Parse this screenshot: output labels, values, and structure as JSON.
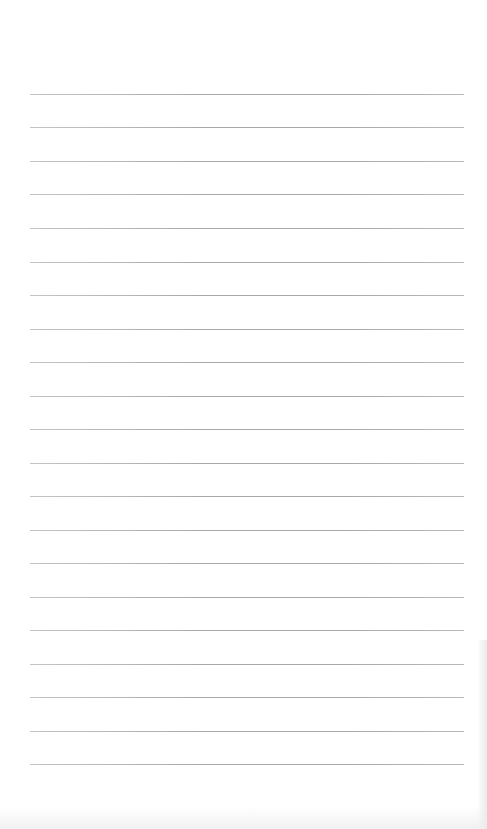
{
  "document": {
    "type": "lined-paper",
    "background_color": "#ffffff",
    "line_color": "#a9a9a9",
    "line_count": 21,
    "line_start_x": 30,
    "line_end_x": 464,
    "first_line_y": 94,
    "line_spacing": 33.5,
    "lines": [
      {
        "y": 94
      },
      {
        "y": 127
      },
      {
        "y": 161
      },
      {
        "y": 194
      },
      {
        "y": 228
      },
      {
        "y": 262
      },
      {
        "y": 295
      },
      {
        "y": 329
      },
      {
        "y": 362
      },
      {
        "y": 396
      },
      {
        "y": 429
      },
      {
        "y": 463
      },
      {
        "y": 496
      },
      {
        "y": 530
      },
      {
        "y": 563
      },
      {
        "y": 597
      },
      {
        "y": 630
      },
      {
        "y": 664
      },
      {
        "y": 697
      },
      {
        "y": 731
      },
      {
        "y": 764
      }
    ]
  }
}
